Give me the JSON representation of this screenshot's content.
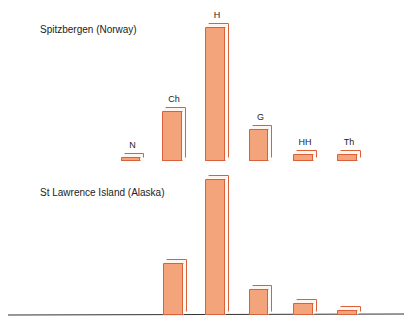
{
  "chart_data": [
    {
      "type": "bar",
      "title": "Spitzbergen (Norway)",
      "categories": [
        "N",
        "Ch",
        "H",
        "G",
        "HH",
        "Th"
      ],
      "values": [
        3,
        37,
        100,
        24,
        6,
        6
      ],
      "xlabel": "",
      "ylabel": "",
      "grid": false,
      "legend": "none",
      "style": "3d-bars",
      "baseline_y": 161,
      "bars_px": [
        {
          "label": "N",
          "x": 121,
          "w": 19,
          "h": 4
        },
        {
          "label": "Ch",
          "x": 162,
          "w": 20,
          "h": 50
        },
        {
          "label": "H",
          "x": 205,
          "w": 20,
          "h": 134
        },
        {
          "label": "G",
          "x": 249,
          "w": 19,
          "h": 32
        },
        {
          "label": "HH",
          "x": 293,
          "w": 20,
          "h": 7
        },
        {
          "label": "Th",
          "x": 337,
          "w": 20,
          "h": 7
        }
      ]
    },
    {
      "type": "bar",
      "title": "St Lawrence Island (Alaska)",
      "categories": [
        "Ch",
        "H",
        "G",
        "HH",
        "Th"
      ],
      "values": [
        38,
        100,
        19,
        9,
        4
      ],
      "xlabel": "",
      "ylabel": "",
      "grid": false,
      "legend": "none",
      "style": "3d-bars",
      "baseline_y": 315,
      "bars_px": [
        {
          "label": "Ch",
          "x": 163,
          "w": 20,
          "h": 52
        },
        {
          "label": "H",
          "x": 205,
          "w": 20,
          "h": 136
        },
        {
          "label": "G",
          "x": 249,
          "w": 19,
          "h": 26
        },
        {
          "label": "HH",
          "x": 293,
          "w": 20,
          "h": 12
        },
        {
          "label": "Th",
          "x": 337,
          "w": 20,
          "h": 5
        }
      ]
    }
  ],
  "colors": {
    "bar_fill": "#f4a47a",
    "bar_edge": "#d9623a",
    "bar_top": "#fff4ee",
    "axis": "#333333"
  }
}
